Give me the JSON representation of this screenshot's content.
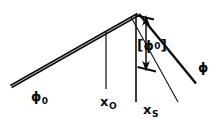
{
  "figure": {
    "name": "ray-geometry-diagram",
    "background_color": "#ffffff",
    "ink_color": "#0d0d0d",
    "width": 218,
    "height": 124
  },
  "labels": {
    "incident_ray": {
      "base": "ϕ",
      "sub": "0"
    },
    "object_position": {
      "base": "x",
      "sub": "O"
    },
    "source_position": {
      "base": "x",
      "sub": "S"
    },
    "outgoing_ray": {
      "base": "ϕ"
    },
    "offset_measure": {
      "open": "[",
      "base": "ϕ",
      "sup": "0",
      "close": "]"
    }
  },
  "geometry": {
    "apex": {
      "x": 137,
      "y": 14
    },
    "incident_ray_thick": {
      "x1": 12,
      "y1": 85,
      "x2": 137,
      "y2": 14
    },
    "outgoing_ray": {
      "x1": 139,
      "y1": 14,
      "x2": 196,
      "y2": 83
    },
    "thin_diagonal": {
      "x1": 132,
      "y1": 18,
      "x2": 177,
      "y2": 101
    },
    "vertical_xo": {
      "x": 106,
      "y1": 33,
      "y2": 88
    },
    "vertical_xs": {
      "x": 136,
      "y1": 14,
      "y2": 101
    },
    "arrow_top_tick": {
      "x1": 137,
      "y1": 15,
      "x2": 153,
      "y2": 19
    },
    "arrow_bottom_tick": {
      "x1": 138,
      "y1": 67,
      "x2": 155,
      "y2": 71
    },
    "double_arrow": {
      "x": 146,
      "y_top": 18,
      "y_bottom": 69
    }
  }
}
